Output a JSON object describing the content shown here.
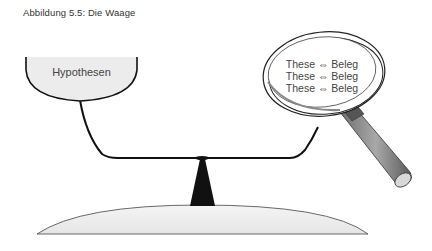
{
  "figure": {
    "caption": "Abbildung 5.5: Die Waage"
  },
  "left_pan": {
    "label": "Hypothesen"
  },
  "magnifier": {
    "lines": [
      "These ⇔ Beleg",
      "These ⇔ Beleg",
      "These ⇔ Beleg"
    ]
  },
  "colors": {
    "stroke": "#111111",
    "pan_fill": "#ececec",
    "base_fill": "#efefef",
    "handle": "#8a8a8a"
  }
}
